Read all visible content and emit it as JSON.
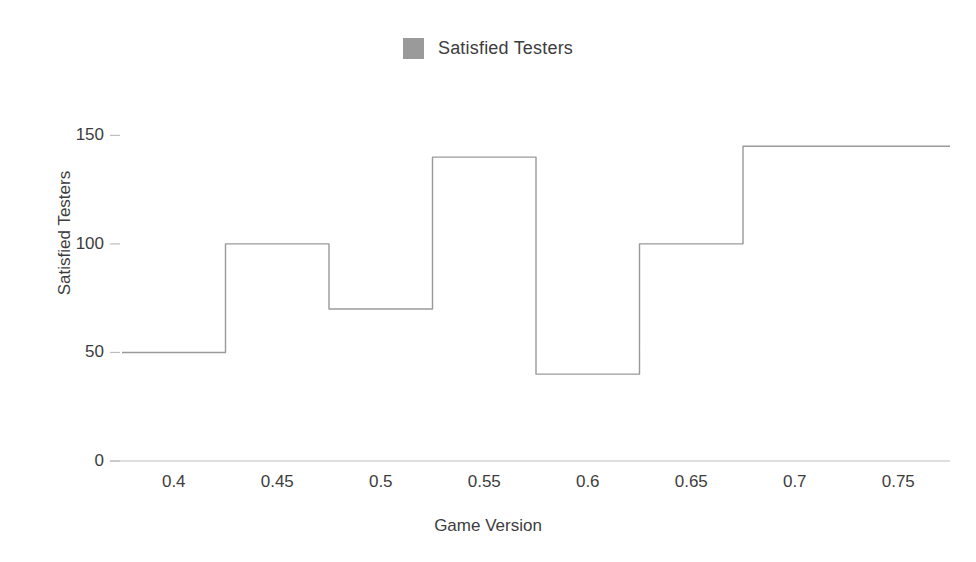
{
  "chart_data": {
    "type": "line",
    "variant": "step-mid",
    "title": "",
    "xlabel": "Game Version",
    "ylabel": "Satisfied Testers",
    "x": [
      0.4,
      0.45,
      0.5,
      0.55,
      0.6,
      0.65,
      0.7,
      0.75
    ],
    "series": [
      {
        "name": "Satisfied Testers",
        "values": [
          50,
          100,
          70,
          140,
          40,
          100,
          145,
          145
        ],
        "color": "#9a9a9a"
      }
    ],
    "xlim": [
      0.375,
      0.775
    ],
    "ylim": [
      0,
      158
    ],
    "xticks": [
      0.4,
      0.45,
      0.5,
      0.55,
      0.6,
      0.65,
      0.7,
      0.75
    ],
    "xtick_labels": [
      "0.4",
      "0.45",
      "0.5",
      "0.55",
      "0.6",
      "0.65",
      "0.7",
      "0.75"
    ],
    "yticks": [
      0,
      50,
      100,
      150
    ],
    "ytick_labels": [
      "0",
      "50",
      "100",
      "150"
    ],
    "grid": false,
    "legend_position": "top-center"
  },
  "legend": {
    "items": [
      {
        "label": "Satisfied Testers",
        "color": "#9a9a9a"
      }
    ]
  },
  "axes": {
    "x_title": "Game Version",
    "y_title": "Satisfied Testers"
  }
}
